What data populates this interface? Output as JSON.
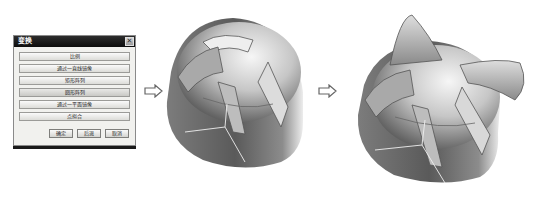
{
  "dialog": {
    "title": "变换",
    "close_glyph": "✕",
    "options": [
      {
        "label": "比例"
      },
      {
        "label": "通过一直线镜像"
      },
      {
        "label": "矩形阵列"
      },
      {
        "label": "圆形阵列"
      },
      {
        "label": "通过一平面镜像"
      },
      {
        "label": "点拟合"
      }
    ],
    "footer": {
      "ok_label": "确定",
      "back_label": "后退",
      "cancel_label": "取消"
    }
  },
  "figure": {
    "step1": "dome-with-four-ribs",
    "step2": "dome-with-four-horns",
    "arrow_icon": "hollow-right-arrow"
  }
}
